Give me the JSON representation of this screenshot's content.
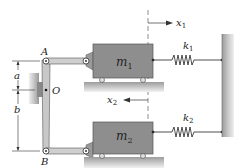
{
  "diagram": {
    "type": "mechanical-system",
    "labels": {
      "point_a": "A",
      "point_b": "B",
      "pivot_o": "O",
      "dim_a": "a",
      "dim_b": "b",
      "mass1": "m",
      "mass1_sub": "1",
      "mass2": "m",
      "mass2_sub": "2",
      "spring1": "k",
      "spring1_sub": "1",
      "spring2": "k",
      "spring2_sub": "2",
      "disp1": "x",
      "disp1_sub": "1",
      "disp2": "x",
      "disp2_sub": "2"
    },
    "colors": {
      "block": "#8a8a8a",
      "block_edge": "#555555",
      "link": "#c8c8c8",
      "ground": "#bdbdbd",
      "wall": "#a8a8a8",
      "line": "#222222"
    }
  }
}
